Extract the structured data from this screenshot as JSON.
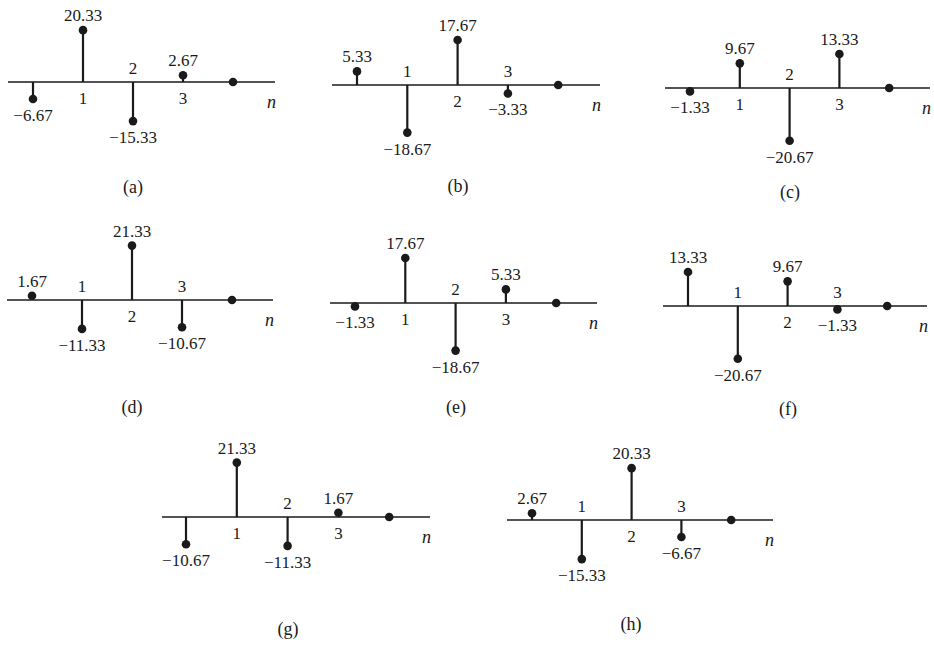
{
  "figure": {
    "axis_variable": "n",
    "colors": {
      "ink": "#1a1a1a",
      "background": "#ffffff"
    },
    "panels": [
      {
        "id": "a",
        "caption": "(a)",
        "values": [
          -6.67,
          20.33,
          -15.33,
          2.67,
          0
        ],
        "value_labels": [
          "−6.67",
          "20.33",
          "−15.33",
          "2.67"
        ],
        "index_labels": [
          "1",
          "2",
          "3"
        ],
        "layout": {
          "axis_y": 82,
          "axis_x0": 8,
          "axis_x1": 275,
          "n0_x": 33,
          "spacing": 50,
          "cap_x": 133,
          "cap_y": 193
        }
      },
      {
        "id": "b",
        "caption": "(b)",
        "values": [
          5.33,
          -18.67,
          17.67,
          -3.33,
          0
        ],
        "value_labels": [
          "5.33",
          "−18.67",
          "17.67",
          "−3.33"
        ],
        "index_labels": [
          "1",
          "2",
          "3"
        ],
        "layout": {
          "axis_y": 85,
          "axis_x0": 332,
          "axis_x1": 600,
          "n0_x": 357,
          "spacing": 50.3,
          "cap_x": 458,
          "cap_y": 192
        }
      },
      {
        "id": "c",
        "caption": "(c)",
        "values": [
          -1.33,
          9.67,
          -20.67,
          13.33,
          0
        ],
        "value_labels": [
          "−1.33",
          "9.67",
          "−20.67",
          "13.33"
        ],
        "index_labels": [
          "1",
          "2",
          "3"
        ],
        "layout": {
          "axis_y": 88,
          "axis_x0": 665,
          "axis_x1": 930,
          "n0_x": 690,
          "spacing": 49.8,
          "cap_x": 790,
          "cap_y": 198
        }
      },
      {
        "id": "d",
        "caption": "(d)",
        "values": [
          1.67,
          -11.33,
          21.33,
          -10.67,
          0
        ],
        "value_labels": [
          "1.67",
          "−11.33",
          "21.33",
          "−10.67"
        ],
        "index_labels": [
          "1",
          "2",
          "3"
        ],
        "layout": {
          "axis_y": 300,
          "axis_x0": 7,
          "axis_x1": 273,
          "n0_x": 32,
          "spacing": 50,
          "cap_x": 132,
          "cap_y": 413
        }
      },
      {
        "id": "e",
        "caption": "(e)",
        "values": [
          -1.33,
          17.67,
          -18.67,
          5.33,
          0
        ],
        "value_labels": [
          "−1.33",
          "17.67",
          "−18.67",
          "5.33"
        ],
        "index_labels": [
          "1",
          "2",
          "3"
        ],
        "layout": {
          "axis_y": 303,
          "axis_x0": 330,
          "axis_x1": 597,
          "n0_x": 355,
          "spacing": 50.3,
          "cap_x": 456,
          "cap_y": 413
        }
      },
      {
        "id": "f",
        "caption": "(f)",
        "values": [
          13.33,
          -20.67,
          9.67,
          -1.33,
          0
        ],
        "value_labels": [
          "13.33",
          "−20.67",
          "9.67",
          "−1.33"
        ],
        "index_labels": [
          "1",
          "2",
          "3"
        ],
        "layout": {
          "axis_y": 306,
          "axis_x0": 663,
          "axis_x1": 927,
          "n0_x": 688,
          "spacing": 49.8,
          "cap_x": 788,
          "cap_y": 415
        }
      },
      {
        "id": "g",
        "caption": "(g)",
        "values": [
          -10.67,
          21.33,
          -11.33,
          1.67,
          0
        ],
        "value_labels": [
          "−10.67",
          "21.33",
          "−11.33",
          "1.67"
        ],
        "index_labels": [
          "1",
          "2",
          "3"
        ],
        "layout": {
          "axis_y": 517,
          "axis_x0": 162,
          "axis_x1": 430,
          "n0_x": 186,
          "spacing": 50.8,
          "cap_x": 288,
          "cap_y": 635
        }
      },
      {
        "id": "h",
        "caption": "(h)",
        "values": [
          2.67,
          -15.33,
          20.33,
          -6.67,
          0
        ],
        "value_labels": [
          "2.67",
          "−15.33",
          "20.33",
          "−6.67"
        ],
        "index_labels": [
          "1",
          "2",
          "3"
        ],
        "layout": {
          "axis_y": 520,
          "axis_x0": 507,
          "axis_x1": 773,
          "n0_x": 532,
          "spacing": 49.8,
          "cap_x": 631,
          "cap_y": 630
        }
      }
    ],
    "px_per_unit": 2.55
  }
}
